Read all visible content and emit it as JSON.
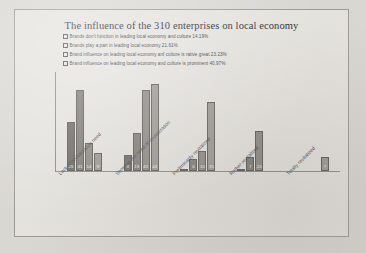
{
  "chart_data": {
    "type": "bar",
    "title": "The influence of the 310 enterprises on local economy",
    "xlabel": "",
    "ylabel": "",
    "grid": false,
    "legend_position": "top-left",
    "ylim": [
      0,
      50
    ],
    "categories": [
      "Lack of revitalization need",
      "Showing the need of revitalization",
      "Preliminarily revitalized",
      "Rather revitalized",
      "Totally revitalized"
    ],
    "series": [
      {
        "name": "Brands don't function in leading local economy and culture  14.19%",
        "color": "#6f6c67",
        "values": [
          25,
          8,
          1,
          1,
          0
        ]
      },
      {
        "name": "Brands play a part in leading local economy  21.61%",
        "color": "#807d78",
        "values": [
          41,
          19,
          6,
          7,
          0
        ]
      },
      {
        "name": "Brand influence on leading local economy anf culture is rative great  23.23%",
        "color": "#8d8a85",
        "values": [
          14,
          41,
          10,
          20,
          0
        ]
      },
      {
        "name": "Brand influence on leading local economy and culture is prominent 40.97%",
        "color": "#9b9893",
        "values": [
          9,
          44,
          35,
          0,
          7
        ]
      }
    ],
    "bar_labels": {
      "group_0": [
        "25",
        "41",
        "14",
        "9"
      ],
      "group_1": [
        "8",
        "19",
        "41",
        "44"
      ],
      "group_2": [
        "1",
        "6",
        "10",
        "35"
      ],
      "group_3": [
        "1",
        "7",
        "20",
        ""
      ],
      "group_4": [
        "",
        "",
        "",
        "7"
      ]
    }
  },
  "colors": {
    "page_background": "#d9d7d2",
    "chart_background": "#e4e2dd",
    "frame_border": "#9d9a94",
    "axis": "#8e8b85",
    "text": "#3a3a3a",
    "bar_value_text": "#efeeeb"
  }
}
